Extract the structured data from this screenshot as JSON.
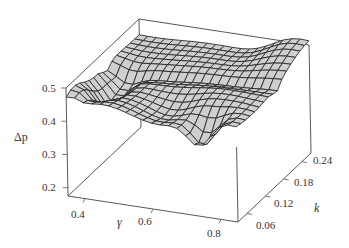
{
  "chart_data": {
    "type": "surface3d",
    "title": "",
    "xlabel": "γ",
    "ylabel": "k",
    "zlabel": "Δp",
    "x_ticks": [
      0.4,
      0.6,
      0.8
    ],
    "y_ticks": [
      0.06,
      0.12,
      0.18,
      0.24
    ],
    "z_ticks": [
      0.2,
      0.3,
      0.4,
      0.5
    ],
    "xlim": [
      0.35,
      0.85
    ],
    "ylim": [
      0.03,
      0.27
    ],
    "zlim": [
      0.175,
      0.5
    ],
    "grid_nx": 20,
    "grid_ny": 16,
    "surface_description": "Mostly flat plateau near Δp≈0.45–0.48, rising sharply at high γ / high k corner (~0.5) and at low γ / low k edge (~0.47); a trough (~0.38) at low γ mid-k, and a dip (~0.36) near γ≈0.75, low k.",
    "surface_color": "#cfcfcf",
    "mesh_color": "#2a2a2a"
  },
  "labels": {
    "z_axis": "Δp",
    "x_axis": "γ",
    "y_axis": "k",
    "z_tick_0": "0.5",
    "z_tick_1": "0.4",
    "z_tick_2": "0.3",
    "z_tick_3": "0.2",
    "x_tick_0": "0.4",
    "x_tick_1": "0.6",
    "x_tick_2": "0.8",
    "y_tick_0": "0.06",
    "y_tick_1": "0.12",
    "y_tick_2": "0.18",
    "y_tick_3": "0.24"
  }
}
